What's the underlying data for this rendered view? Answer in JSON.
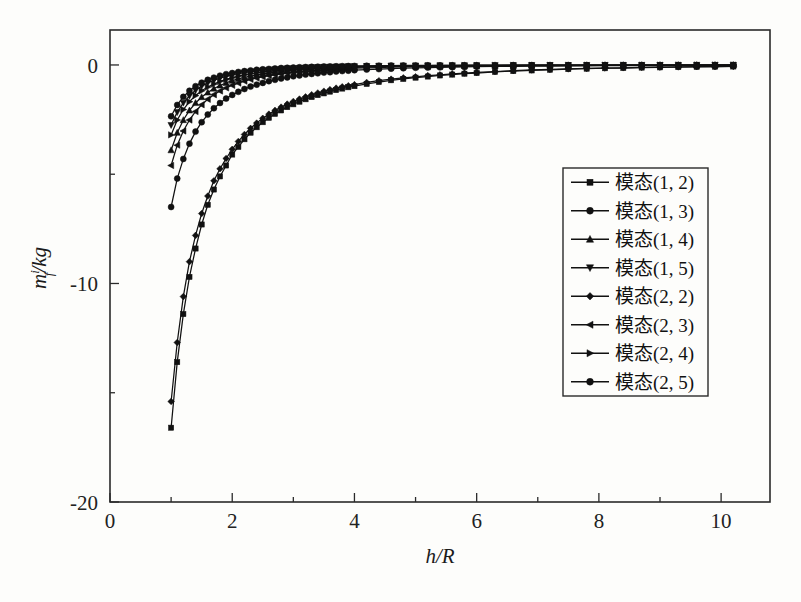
{
  "chart_data": {
    "type": "line",
    "title": "",
    "subtitle": "",
    "xlabel": "h/R",
    "ylabel": "m_f^i/kg",
    "ylabel_parts": {
      "base": "m",
      "sup": "i",
      "sub": "f",
      "unit": "/kg"
    },
    "xlim": [
      0,
      10.8
    ],
    "ylim": [
      -20,
      1.6
    ],
    "x_major_ticks": [
      0,
      2,
      4,
      6,
      8,
      10
    ],
    "x_minor_ticks": [
      1,
      3,
      5,
      7,
      9
    ],
    "x_tick_labels": [
      "0",
      "2",
      "4",
      "6",
      "8",
      "10"
    ],
    "y_major_ticks": [
      0,
      -10,
      -20
    ],
    "y_minor_ticks": [
      -5,
      -15
    ],
    "y_tick_labels": [
      "0",
      "-10",
      "-20"
    ],
    "grid": false,
    "legend_position": "right-middle",
    "box": true,
    "x": [
      1.0,
      1.1,
      1.2,
      1.3,
      1.4,
      1.5,
      1.6,
      1.7,
      1.8,
      1.9,
      2.0,
      2.1,
      2.2,
      2.3,
      2.4,
      2.5,
      2.6,
      2.7,
      2.8,
      2.9,
      3.0,
      3.1,
      3.2,
      3.3,
      3.4,
      3.5,
      3.6,
      3.7,
      3.8,
      3.9,
      4.0,
      4.2,
      4.4,
      4.6,
      4.8,
      5.0,
      5.2,
      5.4,
      5.6,
      5.8,
      6.0,
      6.3,
      6.6,
      6.9,
      7.2,
      7.5,
      7.8,
      8.1,
      8.4,
      8.7,
      9.0,
      9.3,
      9.6,
      9.9,
      10.2
    ],
    "series": [
      {
        "name": "模态(1, 2)",
        "marker": "square",
        "values": [
          -16.6,
          -13.6,
          -11.4,
          -9.7,
          -8.4,
          -7.3,
          -6.4,
          -5.7,
          -5.1,
          -4.6,
          -4.1,
          -3.75,
          -3.4,
          -3.1,
          -2.85,
          -2.62,
          -2.42,
          -2.24,
          -2.08,
          -1.93,
          -1.8,
          -1.68,
          -1.57,
          -1.47,
          -1.38,
          -1.3,
          -1.22,
          -1.15,
          -1.08,
          -1.02,
          -0.97,
          -0.87,
          -0.78,
          -0.7,
          -0.64,
          -0.58,
          -0.53,
          -0.48,
          -0.44,
          -0.4,
          -0.37,
          -0.32,
          -0.28,
          -0.25,
          -0.22,
          -0.19,
          -0.17,
          -0.15,
          -0.14,
          -0.12,
          -0.11,
          -0.1,
          -0.09,
          -0.08,
          -0.07
        ]
      },
      {
        "name": "模态(1, 3)",
        "marker": "circle",
        "values": [
          -6.5,
          -5.2,
          -4.3,
          -3.6,
          -3.05,
          -2.62,
          -2.27,
          -1.98,
          -1.74,
          -1.54,
          -1.37,
          -1.23,
          -1.1,
          -0.99,
          -0.9,
          -0.82,
          -0.74,
          -0.68,
          -0.62,
          -0.57,
          -0.52,
          -0.48,
          -0.44,
          -0.41,
          -0.38,
          -0.35,
          -0.33,
          -0.3,
          -0.28,
          -0.26,
          -0.24,
          -0.21,
          -0.19,
          -0.17,
          -0.15,
          -0.13,
          -0.12,
          -0.11,
          -0.1,
          -0.09,
          -0.08,
          -0.07,
          -0.06,
          -0.055,
          -0.05,
          -0.045,
          -0.04,
          -0.035,
          -0.03,
          -0.03,
          -0.025,
          -0.02,
          -0.02,
          -0.015,
          -0.015
        ]
      },
      {
        "name": "模态(1, 4)",
        "marker": "triangle-up",
        "values": [
          -3.9,
          -3.1,
          -2.52,
          -2.08,
          -1.74,
          -1.47,
          -1.26,
          -1.08,
          -0.94,
          -0.82,
          -0.72,
          -0.64,
          -0.57,
          -0.51,
          -0.45,
          -0.41,
          -0.37,
          -0.33,
          -0.3,
          -0.27,
          -0.25,
          -0.23,
          -0.21,
          -0.19,
          -0.17,
          -0.16,
          -0.15,
          -0.13,
          -0.12,
          -0.11,
          -0.11,
          -0.09,
          -0.08,
          -0.07,
          -0.06,
          -0.055,
          -0.05,
          -0.045,
          -0.04,
          -0.035,
          -0.03,
          -0.028,
          -0.025,
          -0.022,
          -0.02,
          -0.018,
          -0.016,
          -0.014,
          -0.012,
          -0.011,
          -0.01,
          -0.009,
          -0.008,
          -0.007,
          -0.007
        ]
      },
      {
        "name": "模态(1, 5)",
        "marker": "triangle-down",
        "values": [
          -2.75,
          -2.16,
          -1.73,
          -1.41,
          -1.16,
          -0.97,
          -0.82,
          -0.7,
          -0.6,
          -0.52,
          -0.45,
          -0.4,
          -0.35,
          -0.31,
          -0.28,
          -0.25,
          -0.22,
          -0.2,
          -0.18,
          -0.16,
          -0.15,
          -0.135,
          -0.12,
          -0.11,
          -0.1,
          -0.09,
          -0.085,
          -0.078,
          -0.07,
          -0.065,
          -0.06,
          -0.05,
          -0.045,
          -0.04,
          -0.035,
          -0.03,
          -0.027,
          -0.024,
          -0.021,
          -0.019,
          -0.017,
          -0.014,
          -0.012,
          -0.011,
          -0.009,
          -0.008,
          -0.007,
          -0.006,
          -0.006,
          -0.005,
          -0.005,
          -0.004,
          -0.004,
          -0.003,
          -0.003
        ]
      },
      {
        "name": "模态(2, 2)",
        "marker": "diamond",
        "values": [
          -15.4,
          -12.7,
          -10.6,
          -9.0,
          -7.8,
          -6.8,
          -6.0,
          -5.3,
          -4.75,
          -4.28,
          -3.86,
          -3.5,
          -3.18,
          -2.9,
          -2.66,
          -2.44,
          -2.25,
          -2.08,
          -1.93,
          -1.79,
          -1.67,
          -1.56,
          -1.46,
          -1.36,
          -1.28,
          -1.2,
          -1.13,
          -1.06,
          -1.0,
          -0.95,
          -0.9,
          -0.8,
          -0.72,
          -0.65,
          -0.59,
          -0.54,
          -0.49,
          -0.45,
          -0.41,
          -0.37,
          -0.34,
          -0.3,
          -0.26,
          -0.23,
          -0.2,
          -0.18,
          -0.16,
          -0.14,
          -0.13,
          -0.11,
          -0.1,
          -0.09,
          -0.08,
          -0.075,
          -0.07
        ]
      },
      {
        "name": "模态(2, 3)",
        "marker": "triangle-left",
        "values": [
          -4.6,
          -3.67,
          -3.02,
          -2.52,
          -2.13,
          -1.82,
          -1.57,
          -1.36,
          -1.19,
          -1.05,
          -0.93,
          -0.83,
          -0.74,
          -0.66,
          -0.6,
          -0.54,
          -0.49,
          -0.45,
          -0.41,
          -0.37,
          -0.34,
          -0.31,
          -0.29,
          -0.26,
          -0.24,
          -0.22,
          -0.21,
          -0.19,
          -0.18,
          -0.17,
          -0.15,
          -0.13,
          -0.12,
          -0.1,
          -0.09,
          -0.08,
          -0.075,
          -0.067,
          -0.06,
          -0.055,
          -0.05,
          -0.042,
          -0.037,
          -0.032,
          -0.028,
          -0.025,
          -0.022,
          -0.019,
          -0.017,
          -0.015,
          -0.013,
          -0.012,
          -0.011,
          -0.01,
          -0.009
        ]
      },
      {
        "name": "模态(2, 4)",
        "marker": "triangle-right",
        "values": [
          -3.2,
          -2.52,
          -2.04,
          -1.68,
          -1.4,
          -1.18,
          -1.01,
          -0.87,
          -0.75,
          -0.66,
          -0.58,
          -0.51,
          -0.45,
          -0.4,
          -0.36,
          -0.32,
          -0.29,
          -0.26,
          -0.24,
          -0.22,
          -0.2,
          -0.18,
          -0.165,
          -0.15,
          -0.14,
          -0.13,
          -0.12,
          -0.11,
          -0.1,
          -0.092,
          -0.085,
          -0.073,
          -0.063,
          -0.055,
          -0.048,
          -0.042,
          -0.037,
          -0.033,
          -0.029,
          -0.026,
          -0.023,
          -0.019,
          -0.016,
          -0.014,
          -0.012,
          -0.01,
          -0.009,
          -0.008,
          -0.007,
          -0.006,
          -0.006,
          -0.005,
          -0.004,
          -0.004,
          -0.003
        ]
      },
      {
        "name": "模态(2, 5)",
        "marker": "circle",
        "values": [
          -2.35,
          -1.83,
          -1.46,
          -1.18,
          -0.97,
          -0.81,
          -0.68,
          -0.58,
          -0.49,
          -0.42,
          -0.37,
          -0.32,
          -0.28,
          -0.25,
          -0.22,
          -0.2,
          -0.18,
          -0.16,
          -0.14,
          -0.13,
          -0.12,
          -0.105,
          -0.095,
          -0.087,
          -0.079,
          -0.072,
          -0.066,
          -0.06,
          -0.055,
          -0.05,
          -0.046,
          -0.039,
          -0.033,
          -0.028,
          -0.024,
          -0.021,
          -0.018,
          -0.016,
          -0.014,
          -0.012,
          -0.011,
          -0.009,
          -0.007,
          -0.006,
          -0.005,
          -0.005,
          -0.004,
          -0.003,
          -0.003,
          -0.003,
          -0.002,
          -0.002,
          -0.002,
          -0.002,
          -0.001
        ]
      }
    ]
  },
  "legend": {
    "entries": [
      {
        "label": "模态(1, 2)",
        "marker": "square"
      },
      {
        "label": "模态(1, 3)",
        "marker": "circle"
      },
      {
        "label": "模态(1, 4)",
        "marker": "triangle-up"
      },
      {
        "label": "模态(1, 5)",
        "marker": "triangle-down"
      },
      {
        "label": "模态(2, 2)",
        "marker": "diamond"
      },
      {
        "label": "模态(2, 3)",
        "marker": "triangle-left"
      },
      {
        "label": "模态(2, 4)",
        "marker": "triangle-right"
      },
      {
        "label": "模态(2, 5)",
        "marker": "circle"
      }
    ]
  },
  "colors": {
    "ink": "#111111",
    "axis": "#2a2a2a",
    "background": "#fdfdfb"
  }
}
